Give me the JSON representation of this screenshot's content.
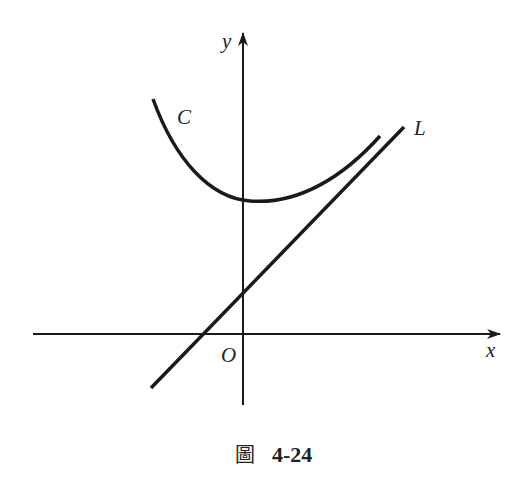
{
  "figure": {
    "caption_char": "圖",
    "caption_number": "4-24",
    "labels": {
      "y_axis": "y",
      "x_axis": "x",
      "origin": "O",
      "curve": "C",
      "line": "L"
    },
    "colors": {
      "stroke": "#1a1a1a",
      "background": "#ffffff"
    }
  }
}
